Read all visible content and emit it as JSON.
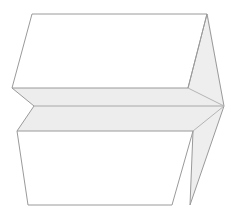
{
  "figure": {
    "title": "3D line-art solid",
    "background_color": "#ffffff",
    "stroke_color": "#9a9a9a",
    "face_fill_color": "#ffffff",
    "band_fill_color": "#ededed",
    "wedge_fill_color": "#eeeeee",
    "canvas": {
      "width": 237,
      "height": 221
    },
    "parts": [
      {
        "name": "upper-face",
        "shape": "parallelogram",
        "points": "32,14 207,14 188,88 12,88"
      },
      {
        "name": "lower-face",
        "shape": "parallelogram",
        "points": "17,131 193,131 172,205 28,205"
      },
      {
        "name": "middle-band",
        "shape": "slab",
        "points": "12,88 188,88 224,106 193,131 17,131 34,106"
      },
      {
        "name": "right-wedge",
        "shape": "lens",
        "points": "208,14 224,106 190,205 188,88 193,131"
      },
      {
        "name": "band-crease",
        "shape": "line",
        "points": "34,106 224,106"
      }
    ]
  }
}
